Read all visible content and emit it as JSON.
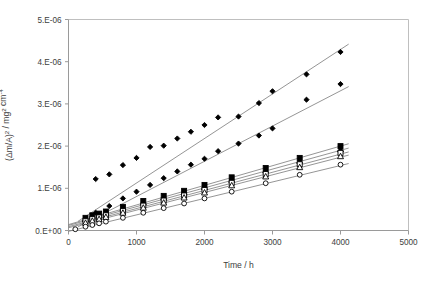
{
  "chart_data": {
    "type": "scatter",
    "title": "",
    "subtitle": "",
    "xlabel": "Time / h",
    "ylabel": "(Δm/A)² / mg² cm⁻⁴",
    "ylabel_parts": {
      "base1": "(Δm/A)",
      "sup1": "2",
      "mid": " / mg",
      "sup2": "2",
      "base2": " cm",
      "sup3": "-4"
    },
    "xlim": [
      0,
      5000
    ],
    "ylim": [
      0,
      5e-06
    ],
    "xticks": [
      0,
      1000,
      2000,
      3000,
      4000,
      5000
    ],
    "xtick_labels": [
      "0",
      "1000",
      "2000",
      "3000",
      "4000",
      "5000"
    ],
    "yticks": [
      0,
      1e-06,
      2e-06,
      3e-06,
      4e-06,
      5e-06
    ],
    "ytick_labels": [
      "0.E+00",
      "1.E-06",
      "2.E-06",
      "3.E-06",
      "4.E-06",
      "5.E-06"
    ],
    "grid": false,
    "legend": "none",
    "marker_colors": {
      "fill": "#000000",
      "open_fill": "#ffffff",
      "stroke": "#000000",
      "trendline": "#7a7a7a",
      "axis": "#9a9a9a"
    },
    "series": [
      {
        "name": "series-1",
        "marker": "filled-diamond",
        "trendline": {
          "slope": 1.055e-09,
          "intercept": 7e-08
        },
        "x": [
          400,
          600,
          800,
          1000,
          1200,
          1400,
          1600,
          1800,
          2000,
          2200,
          2500,
          2800,
          3000,
          3500,
          4000
        ],
        "y": [
          1.22e-06,
          1.33e-06,
          1.55e-06,
          1.72e-06,
          1.98e-06,
          2.01e-06,
          2.18e-06,
          2.34e-06,
          2.5e-06,
          2.68e-06,
          2.7e-06,
          3.02e-06,
          3.3e-06,
          3.7e-06,
          4.23e-06
        ]
      },
      {
        "name": "series-2",
        "marker": "filled-diamond",
        "trendline": {
          "slope": 8.35e-10,
          "intercept": -3e-08
        },
        "x": [
          400,
          600,
          800,
          1000,
          1200,
          1400,
          1600,
          1800,
          2000,
          2200,
          2500,
          2800,
          3000,
          3500,
          4000
        ],
        "y": [
          4.2e-07,
          5.8e-07,
          7.6e-07,
          9.2e-07,
          1.08e-06,
          1.24e-06,
          1.4e-06,
          1.56e-06,
          1.7e-06,
          1.88e-06,
          2.06e-06,
          2.25e-06,
          2.42e-06,
          3.1e-06,
          3.47e-06
        ]
      },
      {
        "name": "series-3",
        "marker": "filled-square",
        "trendline": {
          "slope": 4.65e-10,
          "intercept": 1.4e-07
        },
        "x": [
          250,
          350,
          450,
          550,
          800,
          1100,
          1400,
          1700,
          2000,
          2400,
          2900,
          3400,
          4000
        ],
        "y": [
          3e-07,
          3.6e-07,
          4e-07,
          4.5e-07,
          5.6e-07,
          7e-07,
          8.2e-07,
          9.4e-07,
          1.08e-06,
          1.26e-06,
          1.48e-06,
          1.72e-06,
          2e-06
        ]
      },
      {
        "name": "series-4",
        "marker": "filled-triangle",
        "trendline": {
          "slope": 4.45e-10,
          "intercept": 1.2e-07
        },
        "x": [
          250,
          350,
          450,
          550,
          800,
          1100,
          1400,
          1700,
          2000,
          2400,
          2900,
          3400,
          4000
        ],
        "y": [
          2.7e-07,
          3.3e-07,
          3.7e-07,
          4.2e-07,
          5.2e-07,
          6.6e-07,
          7.8e-07,
          9e-07,
          1.03e-06,
          1.2e-06,
          1.42e-06,
          1.65e-06,
          1.92e-06
        ]
      },
      {
        "name": "series-5",
        "marker": "open-square",
        "trendline": {
          "slope": 4.3e-10,
          "intercept": 9e-08
        },
        "x": [
          250,
          350,
          450,
          550,
          800,
          1100,
          1400,
          1700,
          2000,
          2400,
          2900,
          3400,
          4000
        ],
        "y": [
          2.2e-07,
          2.7e-07,
          3.1e-07,
          3.6e-07,
          4.6e-07,
          5.9e-07,
          7.1e-07,
          8.3e-07,
          9.6e-07,
          1.13e-06,
          1.34e-06,
          1.57e-06,
          1.84e-06
        ]
      },
      {
        "name": "series-6",
        "marker": "open-triangle",
        "trendline": {
          "slope": 4.18e-10,
          "intercept": 6.5e-08
        },
        "x": [
          250,
          350,
          450,
          550,
          800,
          1100,
          1400,
          1700,
          2000,
          2400,
          2900,
          3400,
          4000
        ],
        "y": [
          1.8e-07,
          2.3e-07,
          2.7e-07,
          3.2e-07,
          4.2e-07,
          5.4e-07,
          6.6e-07,
          7.8e-07,
          9e-07,
          1.07e-06,
          1.28e-06,
          1.5e-06,
          1.76e-06
        ]
      },
      {
        "name": "series-7",
        "marker": "open-circle",
        "trendline": {
          "slope": 3.9e-10,
          "intercept": -2e-08
        },
        "x": [
          100,
          250,
          350,
          450,
          550,
          800,
          1100,
          1400,
          1700,
          2000,
          2400,
          2900,
          3400,
          4000
        ],
        "y": [
          3e-08,
          9e-08,
          1.3e-07,
          1.7e-07,
          2.1e-07,
          3e-07,
          4.2e-07,
          5.3e-07,
          6.4e-07,
          7.6e-07,
          9.2e-07,
          1.12e-06,
          1.32e-06,
          1.56e-06
        ]
      }
    ]
  }
}
